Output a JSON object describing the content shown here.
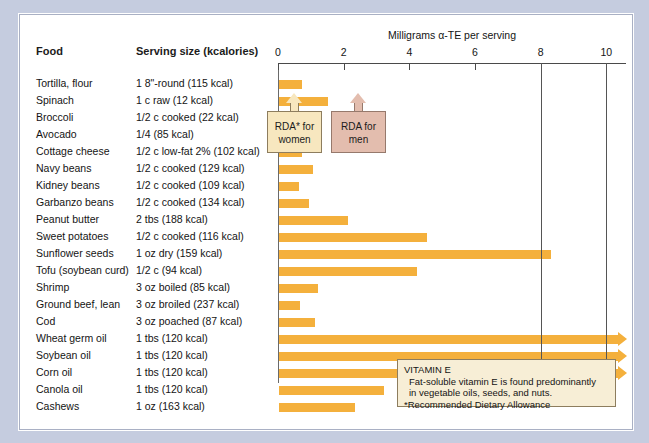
{
  "headers": {
    "food": "Food",
    "serving": "Serving size (kcalories)"
  },
  "chart_data": {
    "type": "bar",
    "orientation": "horizontal",
    "title": "",
    "xlabel": "Milligrams α-TE per serving",
    "ylabel": "",
    "xlim": [
      0,
      10.6
    ],
    "xticks": [
      0,
      2,
      4,
      6,
      8,
      10
    ],
    "xticklabels": [
      "0",
      "2",
      "4",
      "6",
      "8",
      "10"
    ],
    "grid": false,
    "legend": false,
    "bar_color": "#f4b03c",
    "categories": [
      "Tortilla, flour",
      "Spinach",
      "Broccoli",
      "Avocado",
      "Cottage cheese",
      "Navy beans",
      "Kidney beans",
      "Garbanzo beans",
      "Peanut butter",
      "Sweet potatoes",
      "Sunflower seeds",
      "Tofu (soybean curd)",
      "Shrimp",
      "Ground beef, lean",
      "Cod",
      "Wheat germ oil",
      "Soybean oil",
      "Corn oil",
      "Canola oil",
      "Cashews"
    ],
    "serving_sizes": [
      "1 8\"-round (115 kcal)",
      "1 c raw (12 kcal)",
      "1/2 c cooked (22 kcal)",
      "1/4 (85 kcal)",
      "1/2 c low-fat 2% (102 kcal)",
      "1/2 c cooked (129 kcal)",
      "1/2 c cooked (109 kcal)",
      "1/2 c cooked (134 kcal)",
      "2 tbs (188 kcal)",
      "1/2 c cooked (116 kcal)",
      "1 oz dry (159 kcal)",
      "1/2 c (94 kcal)",
      "3 oz boiled (85 kcal)",
      "3 oz broiled (237 kcal)",
      "3 oz poached (87 kcal)",
      "1 tbs (120 kcal)",
      "1 tbs (120 kcal)",
      "1 tbs (120 kcal)",
      "1 tbs (120 kcal)",
      "1 oz (163 kcal)"
    ],
    "values": [
      0.7,
      1.5,
      0.95,
      1.15,
      0.7,
      1.05,
      0.6,
      0.9,
      2.1,
      4.5,
      8.3,
      4.2,
      1.2,
      0.65,
      1.1,
      10.6,
      10.6,
      10.6,
      3.2,
      2.3
    ],
    "truncated": [
      false,
      false,
      false,
      false,
      false,
      false,
      false,
      false,
      false,
      false,
      false,
      false,
      false,
      false,
      false,
      true,
      true,
      true,
      false,
      false
    ],
    "reference_lines": [
      {
        "label": "RDA* for women",
        "value": 8,
        "color": "#f7e7bf"
      },
      {
        "label": "RDA for men",
        "value": 10,
        "color": "#e3bdae"
      }
    ]
  },
  "rda": {
    "women_line1": "RDA* for",
    "women_line2": "women",
    "men_line1": "RDA for",
    "men_line2": "men"
  },
  "note": {
    "title": "VITAMIN E",
    "body_line1": "Fat-soluble vitamin E is found predominantly",
    "body_line2": "in vegetable oils, seeds, and nuts.",
    "footnote": "*Recommended Dietary Allowance"
  }
}
